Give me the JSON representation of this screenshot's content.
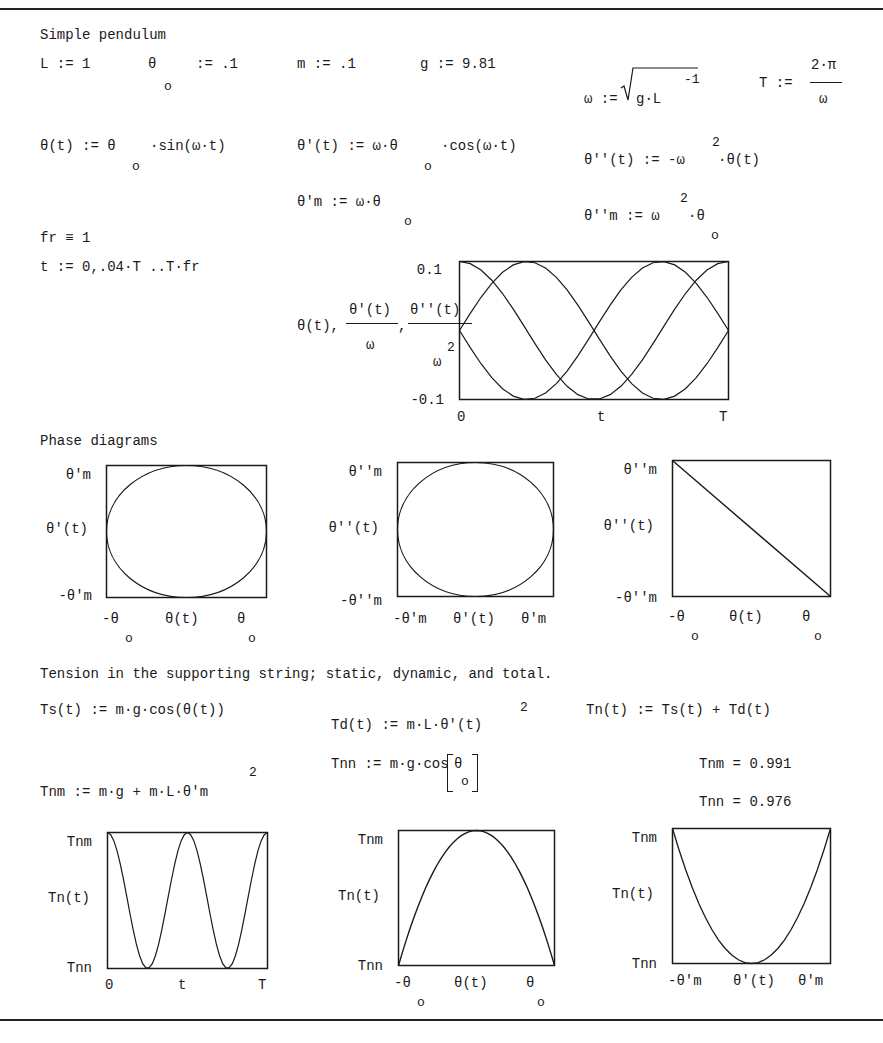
{
  "document": {
    "title": "Simple pendulum",
    "params": {
      "L": "L := 1",
      "theta0_lhs": "θ",
      "theta0_sub": "o",
      "theta0_rhs": ":= .1",
      "m": "m := .1",
      "g": "g := 9.81",
      "omega_lhs": "ω :=",
      "omega_rad": "g·L",
      "omega_exp": "-1",
      "T_lhs": "T :=",
      "T_num": "2·π",
      "T_den": "ω"
    },
    "defs": {
      "theta_t_lhs": "θ(t) := θ",
      "theta_t_sub": "o",
      "theta_t_rhs": "·sin(ω·t)",
      "theta1_t_lhs": "θ'(t) := ω·θ",
      "theta1_t_sub": "o",
      "theta1_t_rhs": "·cos(ω·t)",
      "theta2_t_lhs": "θ''(t) := -ω",
      "theta2_t_exp": "2",
      "theta2_t_rhs": "·θ(t)",
      "theta1m_lhs": "θ'm := ω·θ",
      "theta1m_sub": "o",
      "theta2m_lhs": "θ''m := ω",
      "theta2m_exp": "2",
      "theta2m_mid": "·θ",
      "theta2m_sub": "o",
      "fr": "fr ≡ 1",
      "t_range": "t := 0,.04·T ..T·fr"
    },
    "phase_heading": "Phase diagrams",
    "tension_heading": "Tension in the supporting string; static, dynamic, and total.",
    "tension": {
      "Ts": "Ts(t) := m·g·cos(θ(t))",
      "Td_lhs": "Td(t) := m·L·θ'(t)",
      "Td_exp": "2",
      "Tn": "Tn(t) := Ts(t) + Td(t)",
      "Tnn_def_lhs": "Tnn := m·g·cos",
      "Tnn_def_theta": "θ",
      "Tnn_def_sub": "o",
      "Tnm_def": "Tnm := m·g + m·L·θ'm",
      "Tnm_def_exp": "2",
      "Tnm_result": "Tnm = 0.991",
      "Tnn_result": "Tnn = 0.976"
    }
  },
  "chart_data": [
    {
      "id": "time-plot",
      "type": "line",
      "title": "",
      "ylabel_parts": [
        "θ(t),",
        "θ'(t)",
        "ω",
        ",",
        "θ''(t)",
        "ω",
        "2"
      ],
      "xlabel": "t",
      "x_ticks": [
        "0",
        "T"
      ],
      "y_ticks": [
        "0.1",
        "-0.1"
      ],
      "ylim": [
        -0.1,
        0.1
      ],
      "x_range": [
        0,
        2.006
      ],
      "x_step": "0.04·T",
      "series": [
        {
          "name": "θ(t)",
          "formula": "0.1·sin(ω·t)",
          "periods": 1
        },
        {
          "name": "θ'(t)/ω",
          "formula": "0.1·cos(ω·t)",
          "periods": 1
        },
        {
          "name": "θ''(t)/ω²",
          "formula": "-0.1·sin(ω·t)",
          "periods": 1
        }
      ],
      "grid": false
    },
    {
      "id": "phase-1",
      "type": "line",
      "xlabel": "θ(t)",
      "ylabel": "θ'(t)",
      "x_ticks": [
        "-θo",
        "θo"
      ],
      "y_ticks": [
        "θ'm",
        "-θ'm"
      ],
      "shape": "ellipse"
    },
    {
      "id": "phase-2",
      "type": "line",
      "xlabel": "θ'(t)",
      "ylabel": "θ''(t)",
      "x_ticks": [
        "-θ'm",
        "θ'm"
      ],
      "y_ticks": [
        "θ''m",
        "-θ''m"
      ],
      "shape": "ellipse"
    },
    {
      "id": "phase-3",
      "type": "line",
      "xlabel": "θ(t)",
      "ylabel": "θ''(t)",
      "x_ticks": [
        "-θo",
        "θo"
      ],
      "y_ticks": [
        "θ''m",
        "-θ''m"
      ],
      "shape": "line-descending"
    },
    {
      "id": "tension-vs-time",
      "type": "line",
      "xlabel": "t",
      "ylabel": "Tn(t)",
      "x_ticks": [
        "0",
        "T"
      ],
      "y_ticks": [
        "Tnm",
        "Tnn"
      ],
      "ylim": [
        0.976,
        0.991
      ],
      "shape": "cos-squared, two periods"
    },
    {
      "id": "tension-vs-theta",
      "type": "line",
      "xlabel": "θ(t)",
      "ylabel": "Tn(t)",
      "x_ticks": [
        "-θo",
        "θo"
      ],
      "y_ticks": [
        "Tnm",
        "Tnn"
      ],
      "shape": "downward parabola"
    },
    {
      "id": "tension-vs-theta-dot",
      "type": "line",
      "xlabel": "θ'(t)",
      "ylabel": "Tn(t)",
      "x_ticks": [
        "-θ'm",
        "θ'm"
      ],
      "y_ticks": [
        "Tnm",
        "Tnn"
      ],
      "shape": "upward parabola"
    }
  ]
}
